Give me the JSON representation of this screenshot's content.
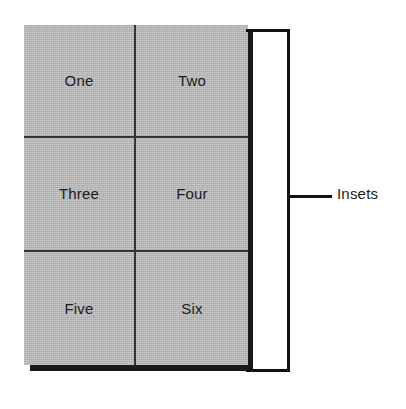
{
  "figure": {
    "type": "insets-diagram",
    "panel": {
      "columns": 2,
      "rows": 3,
      "fill_color": "#b9b9b9",
      "grid_line_color": "#343434",
      "shadow_color": "#1a1a1a",
      "cells": [
        {
          "label": "One",
          "row": 1,
          "column": 1
        },
        {
          "label": "Two",
          "row": 1,
          "column": 2
        },
        {
          "label": "Three",
          "row": 2,
          "column": 1
        },
        {
          "label": "Four",
          "row": 2,
          "column": 2
        },
        {
          "label": "Five",
          "row": 3,
          "column": 1
        },
        {
          "label": "Six",
          "row": 3,
          "column": 2
        }
      ]
    },
    "annotation": {
      "label": "Insets",
      "bracket_color": "#111111",
      "leader_line_color": "#111111"
    }
  }
}
